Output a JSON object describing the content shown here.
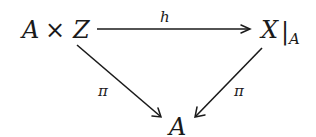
{
  "diagram": {
    "type": "commutative-triangle",
    "nodes": {
      "top_left": {
        "label": "A × Z",
        "parts": [
          "A",
          "×",
          "Z"
        ]
      },
      "top_right": {
        "label": "X|_A",
        "main": "X",
        "bar": "|",
        "subscript": "A"
      },
      "bottom": {
        "label": "A"
      }
    },
    "edges": [
      {
        "from": "top_left",
        "to": "top_right",
        "label": "h"
      },
      {
        "from": "top_left",
        "to": "bottom",
        "label": "π"
      },
      {
        "from": "top_right",
        "to": "bottom",
        "label": "π"
      }
    ],
    "colors": {
      "ink": "#1a1a1a",
      "background": "#ffffff"
    }
  }
}
